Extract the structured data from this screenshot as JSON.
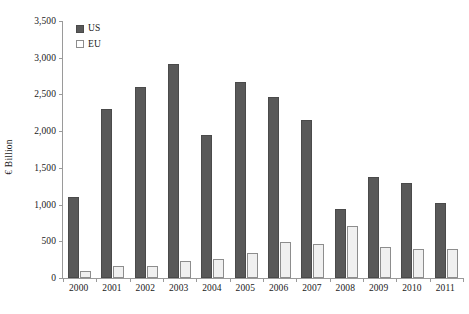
{
  "chart_data": {
    "type": "bar",
    "title": "",
    "subtitle": "",
    "xlabel": "",
    "ylabel": "€ Billion",
    "categories": [
      "2000",
      "2001",
      "2002",
      "2003",
      "2004",
      "2005",
      "2006",
      "2007",
      "2008",
      "2009",
      "2010",
      "2011"
    ],
    "series": [
      {
        "name": "US",
        "color": "#595959",
        "values": [
          1110,
          2300,
          2600,
          2915,
          1945,
          2665,
          2465,
          2155,
          945,
          1370,
          1300,
          1025
        ]
      },
      {
        "name": "EU",
        "color": "#f0f0f0",
        "values": [
          90,
          160,
          170,
          230,
          265,
          345,
          490,
          465,
          715,
          420,
          400,
          390
        ]
      }
    ],
    "ylim": [
      0,
      3500
    ],
    "ytick_step": 500,
    "ytick_labels": [
      "0",
      "500",
      "1,000",
      "1,500",
      "2,000",
      "2,500",
      "3,000",
      "3,500"
    ],
    "ytick_values": [
      0,
      500,
      1000,
      1500,
      2000,
      2500,
      3000,
      3500
    ],
    "grid": false,
    "legend_position": "top-left-inside",
    "legend": [
      {
        "label": "US",
        "swatch": "filled-dark-gray-square"
      },
      {
        "label": "EU",
        "swatch": "outlined-white-square"
      }
    ]
  }
}
